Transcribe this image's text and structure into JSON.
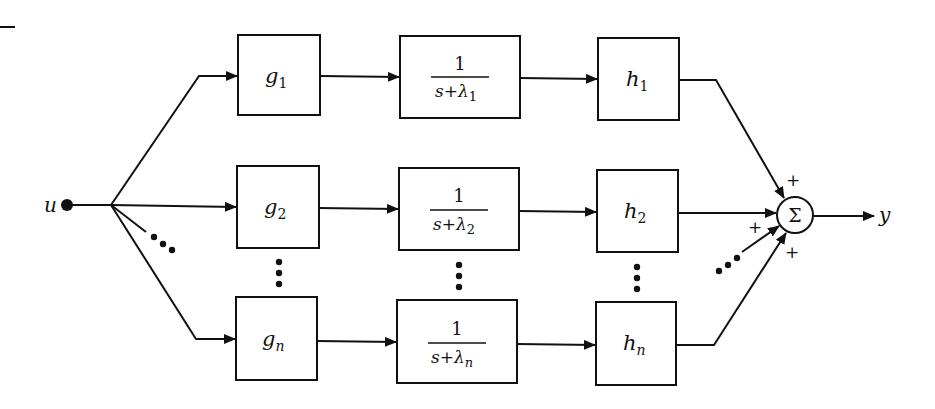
{
  "diagram": {
    "type": "parallel-modal-block-diagram",
    "input": {
      "label": "u"
    },
    "output": {
      "label": "y"
    },
    "summer": {
      "symbol": "Σ",
      "signs": [
        "+",
        "+",
        "+",
        "+"
      ]
    },
    "branches": [
      {
        "input_gain": {
          "base": "g",
          "sub": "1"
        },
        "dynamics": {
          "num": "1",
          "den_prefix": "s+λ",
          "den_sub": "1"
        },
        "output_gain": {
          "base": "h",
          "sub": "1"
        }
      },
      {
        "input_gain": {
          "base": "g",
          "sub": "2"
        },
        "dynamics": {
          "num": "1",
          "den_prefix": "s+λ",
          "den_sub": "2"
        },
        "output_gain": {
          "base": "h",
          "sub": "2"
        }
      },
      {
        "input_gain": {
          "base": "g",
          "sub": "n"
        },
        "dynamics": {
          "num": "1",
          "den_prefix": "s+λ",
          "den_sub": "n"
        },
        "output_gain": {
          "base": "h",
          "sub": "n"
        }
      }
    ],
    "ellipsis": "⋮",
    "colors": {
      "ink": "#111111",
      "background": "#ffffff"
    }
  }
}
